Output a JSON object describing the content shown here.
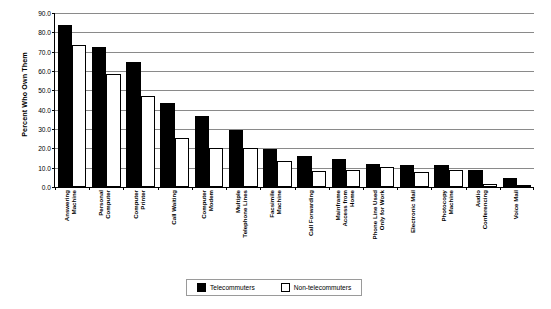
{
  "chart_data": {
    "type": "bar",
    "title": "",
    "xlabel": "",
    "ylabel": "Percent Who Own Them",
    "ylim": [
      0,
      90
    ],
    "ytick_step": 10,
    "ytick_labels": [
      "0.0",
      "10.0",
      "20.0",
      "30.0",
      "40.0",
      "50.0",
      "60.0",
      "70.0",
      "80.0",
      "90.0"
    ],
    "grid": true,
    "legend_position": "bottom-center",
    "categories": [
      "Answering Machine",
      "Personal Computer",
      "Computer Printer",
      "Call Waiting",
      "Computer Modem",
      "Multiple Telephone Lines",
      "Facsimile Machine",
      "Call Forwarding",
      "Mainframe Access from Home",
      "Phone Line Used Only for Work",
      "Electronic Mail",
      "Photocopy Machine",
      "Audio Conferencing",
      "Voice Mail"
    ],
    "category_lines": [
      [
        "Answering",
        "Machine"
      ],
      [
        "Personal",
        "Computer"
      ],
      [
        "Computer",
        "Printer"
      ],
      [
        "Call Waiting"
      ],
      [
        "Computer",
        "Modem"
      ],
      [
        "Multiple",
        "Telephone Lines"
      ],
      [
        "Facsimile",
        "Machine"
      ],
      [
        "Call Forwarding"
      ],
      [
        "Mainframe",
        "Access from",
        "Home"
      ],
      [
        "Phone Line Used",
        "Only for Work"
      ],
      [
        "Electronic Mail"
      ],
      [
        "Photocopy",
        "Machine"
      ],
      [
        "Audio",
        "Conferencing"
      ],
      [
        "Voice Mail"
      ]
    ],
    "series": [
      {
        "name": "Telecommuters",
        "color": "#000000",
        "fill": "solid",
        "values": [
          84.0,
          72.5,
          64.5,
          43.5,
          36.5,
          29.5,
          19.5,
          16.0,
          14.5,
          12.0,
          11.5,
          11.5,
          9.0,
          4.5
        ]
      },
      {
        "name": "Non-telecommuters",
        "color": "#ffffff",
        "fill": "hollow",
        "values": [
          73.5,
          58.5,
          47.0,
          25.5,
          20.0,
          20.0,
          13.5,
          8.5,
          9.0,
          10.5,
          8.0,
          9.0,
          1.5,
          1.0
        ]
      }
    ]
  },
  "legend": {
    "items": [
      {
        "label": "Telecommuters",
        "swatch": "filled-square-icon"
      },
      {
        "label": "Non-telecommuters",
        "swatch": "hollow-square-icon"
      }
    ]
  }
}
